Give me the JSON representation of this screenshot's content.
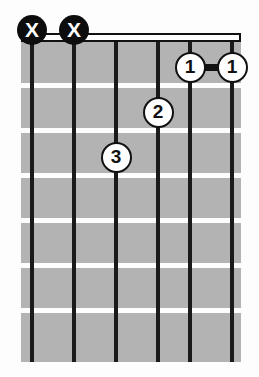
{
  "diagram": {
    "type": "guitar-chord-diagram",
    "orientation": "vertical",
    "string_count": 6,
    "fret_count": 7,
    "start_fret": 1,
    "colors": {
      "background": "#fdfdfd",
      "fretboard": "#b3b3b3",
      "string": "#1a1a1a",
      "fret_line": "#fdfdfd",
      "nut_fill": "#ffffff",
      "nut_border": "#111111",
      "mute_marker_fill": "#0d0d0d",
      "mute_marker_text": "#ffffff",
      "finger_dot_fill": "#ffffff",
      "finger_dot_border": "#111111",
      "finger_dot_text": "#111111",
      "barre_bar": "#111111"
    },
    "geometry": {
      "board_left": 21,
      "board_top": 42,
      "board_width": 220,
      "board_height": 320,
      "string_x": [
        32,
        74,
        116,
        158,
        190,
        232
      ],
      "fret_line_y": [
        83,
        128,
        173,
        218,
        263,
        308
      ],
      "fret_center_y": [
        67,
        112,
        157,
        202,
        247,
        292,
        337
      ]
    },
    "string_markers": [
      {
        "string": 1,
        "symbol": "X",
        "meaning": "muted",
        "x": 32,
        "y": 30
      },
      {
        "string": 2,
        "symbol": "X",
        "meaning": "muted",
        "x": 74,
        "y": 30
      }
    ],
    "finger_positions": [
      {
        "finger": "1",
        "string": 5,
        "fret": 1,
        "x": 190,
        "y": 67
      },
      {
        "finger": "1",
        "string": 6,
        "fret": 1,
        "x": 232,
        "y": 67
      },
      {
        "finger": "2",
        "string": 4,
        "fret": 2,
        "x": 158,
        "y": 112
      },
      {
        "finger": "3",
        "string": 3,
        "fret": 3,
        "x": 116,
        "y": 157
      }
    ],
    "barres": [
      {
        "finger": "1",
        "fret": 1,
        "from_string": 5,
        "to_string": 6,
        "x_start": 190,
        "x_end": 232,
        "y": 67
      }
    ]
  }
}
